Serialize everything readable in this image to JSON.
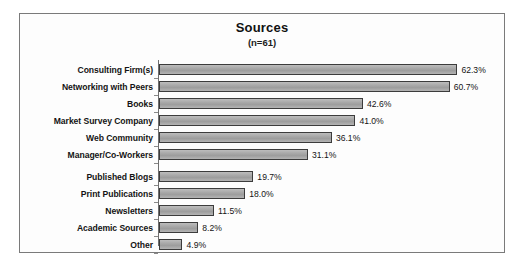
{
  "chart": {
    "title": "Sources",
    "subtitle": "(n=61)"
  },
  "chart_data": {
    "type": "bar",
    "orientation": "horizontal",
    "title": "Sources",
    "subtitle": "(n=61)",
    "xlabel": "",
    "ylabel": "",
    "grid": false,
    "legend": false,
    "sample_size": 61,
    "value_suffix": "%",
    "xlim": [
      0,
      70
    ],
    "categories": [
      "Consulting Firm(s)",
      "Networking with Peers",
      "Books",
      "Market Survey Company",
      "Web Community",
      "Manager/Co-Workers",
      "Published Blogs",
      "Print Publications",
      "Newsletters",
      "Academic Sources",
      "Other"
    ],
    "values": [
      62.3,
      60.7,
      42.6,
      41.0,
      36.1,
      31.1,
      19.7,
      18.0,
      11.5,
      8.2,
      4.9
    ],
    "value_labels": [
      "62.3%",
      "60.7%",
      "42.6%",
      "41.0%",
      "36.1%",
      "31.1%",
      "19.7%",
      "18.0%",
      "11.5%",
      "8.2%",
      "4.9%"
    ],
    "colors": {
      "bar_fill": "#a8a8a8",
      "bar_border": "#3c3c3c",
      "frame": "#7a7a7a",
      "text": "#141414",
      "background": "#fdfdfd"
    }
  }
}
